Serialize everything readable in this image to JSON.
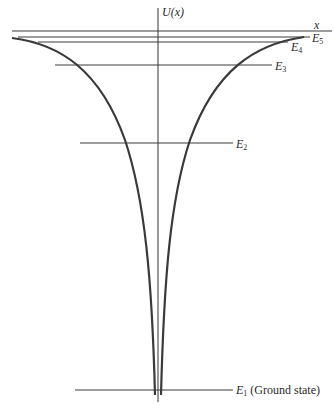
{
  "diagram": {
    "type": "potential-well-energy-levels",
    "axis": {
      "y_label": "U(x)",
      "x_label": "x"
    },
    "energy_levels": [
      {
        "name": "E1",
        "sym": "E",
        "sub": "1",
        "note": "(Ground state)",
        "y": 390,
        "x1": 75,
        "x2": 233
      },
      {
        "name": "E2",
        "sym": "E",
        "sub": "2",
        "note": "",
        "y": 143,
        "x1": 80,
        "x2": 233
      },
      {
        "name": "E3",
        "sym": "E",
        "sub": "3",
        "note": "",
        "y": 65,
        "x1": 55,
        "x2": 272
      },
      {
        "name": "E4",
        "sym": "E",
        "sub": "4",
        "note": "",
        "y": 42,
        "x1": 38,
        "x2": 288
      },
      {
        "name": "E5",
        "sym": "E",
        "sub": "5",
        "note": "",
        "y": 37,
        "x1": 18,
        "x2": 310
      }
    ],
    "colors": {
      "curve": "#3a3a3a",
      "lines": "#3a3a3a",
      "text": "#2a2a2a",
      "background": "#ffffff"
    }
  }
}
